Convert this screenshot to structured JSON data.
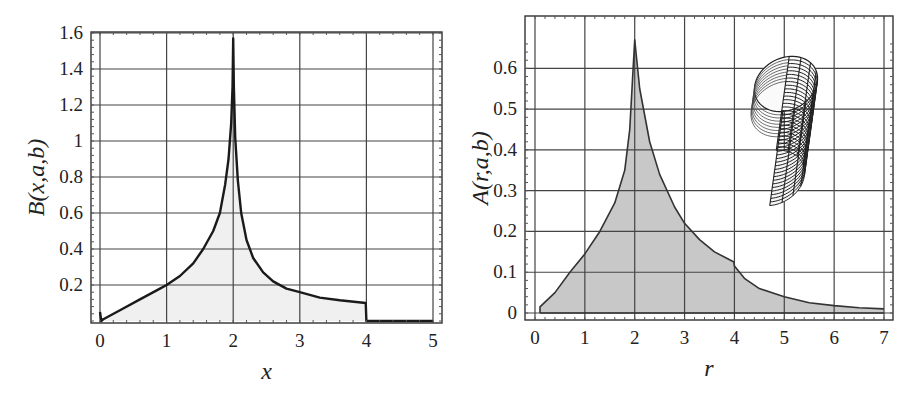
{
  "chart_data": [
    {
      "type": "area",
      "id": "left",
      "title": "",
      "xlabel": "x",
      "ylabel": "B(x,a,b)",
      "xlim": [
        0,
        5
      ],
      "ylim": [
        0,
        1.6
      ],
      "grid": true,
      "xticks": [
        "0",
        "1",
        "2",
        "3",
        "4",
        "5"
      ],
      "yticks": [
        "0.2",
        "0.4",
        "0.6",
        "0.8",
        "1",
        "1.2",
        "1.4",
        "1.6"
      ],
      "fill_color": "#f0f0f0",
      "line_color": "#1a1a1a",
      "series": [
        {
          "name": "B(x,a,b)",
          "x": [
            0.0,
            0.02,
            0.05,
            0.3,
            0.6,
            0.9,
            1.0,
            1.2,
            1.4,
            1.55,
            1.7,
            1.8,
            1.88,
            1.93,
            1.97,
            1.99,
            2.0,
            2.01,
            2.03,
            2.07,
            2.12,
            2.2,
            2.3,
            2.45,
            2.6,
            2.8,
            3.0,
            3.3,
            3.6,
            3.99,
            4.0,
            4.01,
            5.0
          ],
          "y": [
            0.05,
            0.0,
            0.01,
            0.06,
            0.12,
            0.18,
            0.2,
            0.25,
            0.32,
            0.4,
            0.5,
            0.6,
            0.76,
            0.9,
            1.1,
            1.3,
            1.57,
            1.3,
            1.02,
            0.78,
            0.6,
            0.45,
            0.35,
            0.27,
            0.22,
            0.18,
            0.16,
            0.13,
            0.115,
            0.1,
            0.0,
            0.0,
            0.0
          ]
        }
      ]
    },
    {
      "type": "area",
      "id": "right",
      "title": "",
      "xlabel": "r",
      "ylabel": "A(r,a,b)",
      "xlim": [
        0,
        7
      ],
      "ylim": [
        0,
        0.65
      ],
      "grid": true,
      "xticks": [
        "0",
        "1",
        "2",
        "3",
        "4",
        "5",
        "6",
        "7"
      ],
      "yticks": [
        "0",
        "0.1",
        "0.2",
        "0.3",
        "0.4",
        "0.5",
        "0.6"
      ],
      "fill_color": "#c8c8c8",
      "line_color": "#333333",
      "inset": "3D wireframe elliptic cylinder (tilted)",
      "series": [
        {
          "name": "A(r,a,b)",
          "x": [
            0.1,
            0.1,
            0.4,
            0.7,
            1.0,
            1.3,
            1.6,
            1.8,
            1.9,
            2.0,
            2.1,
            2.3,
            2.5,
            2.8,
            3.0,
            3.3,
            3.6,
            3.99,
            4.0,
            4.2,
            4.5,
            5.0,
            5.5,
            6.0,
            6.5,
            7.0
          ],
          "y": [
            0.0,
            0.015,
            0.05,
            0.1,
            0.145,
            0.2,
            0.27,
            0.35,
            0.45,
            0.67,
            0.55,
            0.42,
            0.34,
            0.26,
            0.22,
            0.18,
            0.15,
            0.125,
            0.115,
            0.085,
            0.06,
            0.04,
            0.025,
            0.018,
            0.013,
            0.01
          ]
        }
      ]
    }
  ],
  "layout": {
    "left": {
      "x0px": 100,
      "x1px": 433,
      "y0px": 321,
      "y1px": 33,
      "frame": [
        91,
        32,
        442,
        323
      ]
    },
    "right": {
      "x0px": 535,
      "x1px": 884,
      "y0px": 313,
      "y1px": 48,
      "frame": [
        525,
        16,
        893,
        320
      ]
    }
  }
}
